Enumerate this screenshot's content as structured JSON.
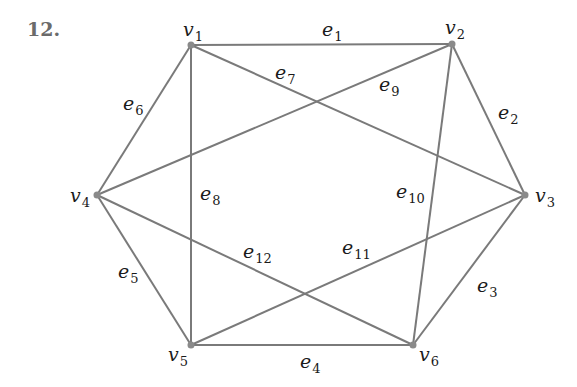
{
  "problem": {
    "number": "12."
  },
  "colors": {
    "edge": "#7a7a7a",
    "vertex": "#8a8a8a",
    "label": "#1a1a1a"
  },
  "vertices": [
    {
      "id": "v1",
      "base": "v",
      "sub": "1",
      "x": 191,
      "y": 45,
      "lx": 183,
      "ly": 20
    },
    {
      "id": "v2",
      "base": "v",
      "sub": "2",
      "x": 452,
      "y": 44,
      "lx": 445,
      "ly": 18
    },
    {
      "id": "v3",
      "base": "v",
      "sub": "3",
      "x": 525,
      "y": 195,
      "lx": 535,
      "ly": 186
    },
    {
      "id": "v4",
      "base": "v",
      "sub": "4",
      "x": 97,
      "y": 195,
      "lx": 70,
      "ly": 186
    },
    {
      "id": "v5",
      "base": "v",
      "sub": "5",
      "x": 191,
      "y": 345,
      "lx": 168,
      "ly": 345
    },
    {
      "id": "v6",
      "base": "v",
      "sub": "6",
      "x": 413,
      "y": 345,
      "lx": 419,
      "ly": 345
    }
  ],
  "edges": [
    {
      "id": "e1",
      "base": "e",
      "sub": "1",
      "from": "v1",
      "to": "v2",
      "lx": 322,
      "ly": 20
    },
    {
      "id": "e2",
      "base": "e",
      "sub": "2",
      "from": "v2",
      "to": "v3",
      "lx": 498,
      "ly": 103
    },
    {
      "id": "e3",
      "base": "e",
      "sub": "3",
      "from": "v3",
      "to": "v6",
      "lx": 477,
      "ly": 276
    },
    {
      "id": "e4",
      "base": "e",
      "sub": "4",
      "from": "v5",
      "to": "v6",
      "lx": 300,
      "ly": 352
    },
    {
      "id": "e5",
      "base": "e",
      "sub": "5",
      "from": "v4",
      "to": "v5",
      "lx": 118,
      "ly": 262
    },
    {
      "id": "e6",
      "base": "e",
      "sub": "6",
      "from": "v1",
      "to": "v4",
      "lx": 123,
      "ly": 94
    },
    {
      "id": "e7",
      "base": "e",
      "sub": "7",
      "from": "v1",
      "to": "v3",
      "lx": 275,
      "ly": 63
    },
    {
      "id": "e8",
      "base": "e",
      "sub": "8",
      "from": "v1",
      "to": "v5",
      "lx": 200,
      "ly": 184
    },
    {
      "id": "e9",
      "base": "e",
      "sub": "9",
      "from": "v2",
      "to": "v4",
      "lx": 379,
      "ly": 75
    },
    {
      "id": "e10",
      "base": "e",
      "sub": "10",
      "from": "v2",
      "to": "v6",
      "lx": 396,
      "ly": 182
    },
    {
      "id": "e11",
      "base": "e",
      "sub": "11",
      "from": "v3",
      "to": "v5",
      "lx": 342,
      "ly": 238
    },
    {
      "id": "e12",
      "base": "e",
      "sub": "12",
      "from": "v4",
      "to": "v6",
      "lx": 243,
      "ly": 242
    }
  ]
}
